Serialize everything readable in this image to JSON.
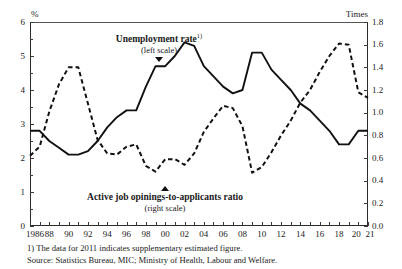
{
  "axes": {
    "left_unit": "%",
    "right_unit": "Times",
    "left_ticks": [
      "6",
      "5",
      "4",
      "3",
      "2",
      "1",
      "0"
    ],
    "right_ticks": [
      "1.8",
      "1.6",
      "1.4",
      "1.2",
      "1.0",
      "0.8",
      "0.6",
      "0.4",
      "0.2",
      "0.0"
    ],
    "x_ticks": [
      "1986",
      "88",
      "90",
      "92",
      "94",
      "96",
      "98",
      "00",
      "02",
      "04",
      "06",
      "08",
      "10",
      "12",
      "14",
      "16",
      "18",
      "20",
      "21"
    ]
  },
  "annotations": {
    "unemployment": {
      "title": "Unemployment rate",
      "marker": "1)",
      "scale": "(left scale)",
      "pointer": "triangle-down-icon"
    },
    "ratio": {
      "title": "Active job opinings-to-applicants ratio",
      "scale": "(right scale)",
      "pointer": "triangle-up-icon"
    }
  },
  "footnotes": {
    "note1": "1) The data for 2011 indicates supplementary estimated figure.",
    "source": "Source:  Statistics Bureau, MIC;  Ministry of Health, Labour and Welfare."
  },
  "colors": {
    "line": "#111111",
    "axis": "#2b2b2b",
    "background": "#ffffff"
  },
  "chart_data": {
    "type": "line",
    "title": "",
    "xlabel": "",
    "ylabel": "%",
    "y2label": "Times",
    "ylim": [
      0,
      6
    ],
    "y2lim": [
      0.0,
      1.8
    ],
    "grid": false,
    "legend": "inline-annotations",
    "x": [
      1986,
      1987,
      1988,
      1989,
      1990,
      1991,
      1992,
      1993,
      1994,
      1995,
      1996,
      1997,
      1998,
      1999,
      2000,
      2001,
      2002,
      2003,
      2004,
      2005,
      2006,
      2007,
      2008,
      2009,
      2010,
      2011,
      2012,
      2013,
      2014,
      2015,
      2016,
      2017,
      2018,
      2019,
      2020,
      2021
    ],
    "series": [
      {
        "name": "Unemployment rate",
        "axis": "left",
        "unit": "%",
        "style": "solid",
        "values": [
          2.8,
          2.8,
          2.5,
          2.3,
          2.1,
          2.1,
          2.2,
          2.5,
          2.9,
          3.2,
          3.4,
          3.4,
          4.1,
          4.7,
          4.7,
          5.0,
          5.4,
          5.3,
          4.7,
          4.4,
          4.1,
          3.9,
          4.0,
          5.1,
          5.1,
          4.6,
          4.3,
          4.0,
          3.6,
          3.4,
          3.1,
          2.8,
          2.4,
          2.4,
          2.8,
          2.8
        ]
      },
      {
        "name": "Active job opinings-to-applicants ratio",
        "axis": "right",
        "unit": "Times",
        "style": "dashed",
        "values": [
          0.62,
          0.7,
          1.01,
          1.25,
          1.4,
          1.4,
          1.08,
          0.76,
          0.64,
          0.63,
          0.7,
          0.72,
          0.53,
          0.48,
          0.59,
          0.59,
          0.54,
          0.64,
          0.83,
          0.95,
          1.06,
          1.04,
          0.88,
          0.47,
          0.52,
          0.65,
          0.8,
          0.93,
          1.09,
          1.2,
          1.36,
          1.5,
          1.61,
          1.6,
          1.18,
          1.13
        ]
      }
    ],
    "annotations": [
      {
        "text": "Unemployment rate 1) (left scale)",
        "points_to_series": "Unemployment rate",
        "at_x": 1999
      },
      {
        "text": "Active job opinings-to-applicants ratio (right scale)",
        "points_to_series": "Active job opinings-to-applicants ratio",
        "at_x": 1997
      }
    ]
  }
}
